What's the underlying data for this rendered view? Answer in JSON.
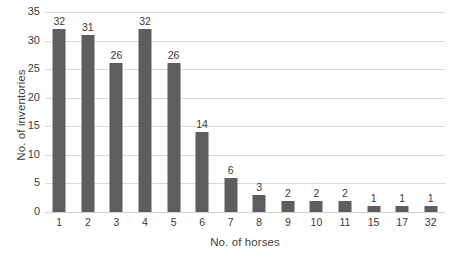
{
  "chart_data": {
    "type": "bar",
    "title": "",
    "xlabel": "No. of horses",
    "ylabel": "No. of inventories",
    "categories": [
      "1",
      "2",
      "3",
      "4",
      "5",
      "6",
      "7",
      "8",
      "9",
      "10",
      "11",
      "15",
      "17",
      "32"
    ],
    "values": [
      32,
      31,
      26,
      32,
      26,
      14,
      6,
      3,
      2,
      2,
      2,
      1,
      1,
      1
    ],
    "data_labels": [
      "32",
      "31",
      "26",
      "32",
      "26",
      "14",
      "6",
      "3",
      "2",
      "2",
      "2",
      "1",
      "1",
      "1"
    ],
    "ylim": [
      0,
      35
    ],
    "ytick_values": [
      0,
      5,
      10,
      15,
      20,
      25,
      30,
      35
    ],
    "ytick_labels": [
      "0",
      "5",
      "10",
      "15",
      "20",
      "25",
      "30",
      "35"
    ],
    "grid": "horizontal",
    "legend": "none",
    "bar_color": "#5e5e5e",
    "gridline_color": "#d9d9d9",
    "text_color": "#3a3a3a"
  }
}
